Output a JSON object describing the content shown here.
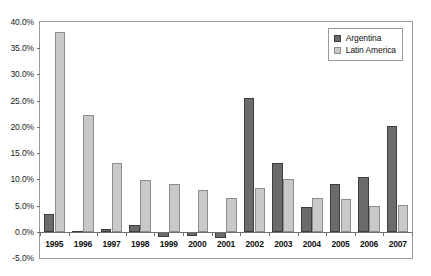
{
  "chart_data": {
    "type": "bar",
    "title": "",
    "subtitle": "",
    "xlabel": "",
    "ylabel": "",
    "categories": [
      "1995",
      "1996",
      "1997",
      "1998",
      "1999",
      "2000",
      "2001",
      "2002",
      "2003",
      "2004",
      "2005",
      "2006",
      "2007"
    ],
    "series": [
      {
        "name": "Argentina",
        "color": "#6b6b6b",
        "values": [
          3.4,
          0.2,
          0.6,
          1.3,
          -1.0,
          -0.9,
          -1.2,
          25.5,
          13.1,
          4.7,
          9.2,
          10.5,
          20.2
        ]
      },
      {
        "name": "Latin America",
        "color": "#c9c9c9",
        "values": [
          38.0,
          22.3,
          13.1,
          9.9,
          9.2,
          8.0,
          6.5,
          8.4,
          10.1,
          6.4,
          6.2,
          5.0,
          5.1
        ]
      }
    ],
    "ylim": [
      -5.0,
      40.0
    ],
    "ytick_values": [
      40.0,
      35.0,
      30.0,
      25.0,
      20.0,
      15.0,
      10.0,
      5.0,
      0.0,
      -5.0
    ],
    "ytick_labels": [
      "40.0%",
      "35.0%",
      "30.0%",
      "25.0%",
      "20.0%",
      "15.0%",
      "10.0%",
      "5.0%",
      "0.0%",
      "-5.0%"
    ],
    "grid": false,
    "legend_position": "top-right",
    "value_format": "percent"
  }
}
